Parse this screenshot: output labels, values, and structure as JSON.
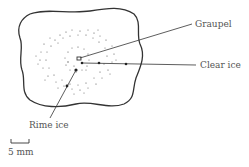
{
  "diagram": {
    "labels": {
      "graupel": "Graupel",
      "clear_ice": "Clear ice",
      "rime_ice": "Rime ice"
    },
    "scale_bar": {
      "label": "5 mm"
    },
    "colors": {
      "ink": "#333333",
      "text": "#555555",
      "background": "#ffffff"
    }
  }
}
